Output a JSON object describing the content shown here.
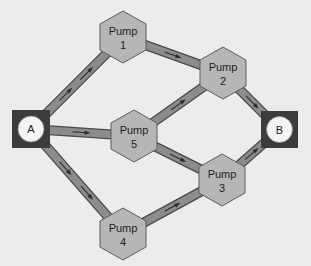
{
  "diagram": {
    "type": "flow-network",
    "terminals": [
      {
        "id": "A",
        "label": "A",
        "role": "source"
      },
      {
        "id": "B",
        "label": "B",
        "role": "sink"
      }
    ],
    "pumps": [
      {
        "id": "P1",
        "line1": "Pump",
        "line2": "1"
      },
      {
        "id": "P2",
        "line1": "Pump",
        "line2": "2"
      },
      {
        "id": "P5",
        "line1": "Pump",
        "line2": "5"
      },
      {
        "id": "P3",
        "line1": "Pump",
        "line2": "3"
      },
      {
        "id": "P4",
        "line1": "Pump",
        "line2": "4"
      }
    ],
    "edges": [
      {
        "from": "A",
        "to": "P1",
        "arrows": 2
      },
      {
        "from": "A",
        "to": "P5",
        "arrows": 1
      },
      {
        "from": "A",
        "to": "P4",
        "arrows": 2
      },
      {
        "from": "P1",
        "to": "P2",
        "arrows": 1
      },
      {
        "from": "P5",
        "to": "P2",
        "arrows": 1
      },
      {
        "from": "P5",
        "to": "P3",
        "arrows": 1
      },
      {
        "from": "P4",
        "to": "P3",
        "arrows": 1
      },
      {
        "from": "P2",
        "to": "B",
        "arrows": 1
      },
      {
        "from": "P3",
        "to": "B",
        "arrows": 1
      }
    ],
    "colors": {
      "background": "#ececea",
      "pipe": "#8c8c8c",
      "pipe_border": "#4a4a4a",
      "pump_fill": "#b6b6b6",
      "terminal_box": "#3c3c3c",
      "terminal_circle": "#f4f4f2"
    }
  }
}
